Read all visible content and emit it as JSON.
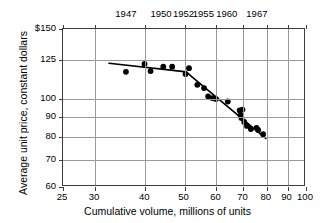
{
  "chart_data": {
    "type": "scatter",
    "title": "",
    "xlabel": "Cumulative volume, millions of units",
    "ylabel": "Average unit price, constant dollars",
    "xscale": "log",
    "yscale": "log",
    "xlim": [
      25,
      100
    ],
    "ylim": [
      60,
      150
    ],
    "grid": true,
    "legend": null,
    "xticks": [
      25,
      30,
      40,
      50,
      60,
      70,
      80,
      90,
      100
    ],
    "xticklabels": [
      "25",
      "30",
      "40",
      "50",
      "60",
      "70",
      "80",
      "90",
      "100"
    ],
    "yticks": [
      60,
      70,
      80,
      90,
      100,
      125,
      150
    ],
    "yticklabels": [
      "60",
      "70",
      "80",
      "90",
      "100",
      "125",
      "$150"
    ],
    "secondary_xaxis": {
      "label": "",
      "ticks": [
        36,
        44,
        50,
        56,
        64,
        76
      ],
      "ticklabels": [
        "1947",
        "1950",
        "1952",
        "1955",
        "1960",
        "1967"
      ]
    },
    "series": [
      {
        "name": "Average unit price",
        "type": "scatter",
        "marker": "filled-circle",
        "color": "#000000",
        "points": [
          {
            "x": 35.8,
            "y": 117.0
          },
          {
            "x": 39.8,
            "y": 122.5
          },
          {
            "x": 41.2,
            "y": 117.5
          },
          {
            "x": 44.3,
            "y": 120.5
          },
          {
            "x": 46.6,
            "y": 120.5
          },
          {
            "x": 50.3,
            "y": 115.5
          },
          {
            "x": 51.3,
            "y": 119.5
          },
          {
            "x": 53.8,
            "y": 108.5
          },
          {
            "x": 55.9,
            "y": 106.5
          },
          {
            "x": 57.2,
            "y": 101.5
          },
          {
            "x": 58.6,
            "y": 100.5
          },
          {
            "x": 59.8,
            "y": 100.0
          },
          {
            "x": 64.0,
            "y": 98.5
          },
          {
            "x": 68.5,
            "y": 93.5
          },
          {
            "x": 68.9,
            "y": 91.0
          },
          {
            "x": 69.2,
            "y": 89.5
          },
          {
            "x": 69.6,
            "y": 94.0
          },
          {
            "x": 70.3,
            "y": 87.5
          },
          {
            "x": 71.4,
            "y": 85.5
          },
          {
            "x": 73.0,
            "y": 84.0
          },
          {
            "x": 75.4,
            "y": 84.5
          },
          {
            "x": 76.1,
            "y": 83.5
          },
          {
            "x": 78.3,
            "y": 81.5
          }
        ]
      },
      {
        "name": "Fitted experience curve",
        "type": "line",
        "color": "#000000",
        "vertices": [
          {
            "x": 32.5,
            "y": 123.0
          },
          {
            "x": 50.5,
            "y": 117.0
          },
          {
            "x": 52.0,
            "y": 114.0
          },
          {
            "x": 79.5,
            "y": 79.5
          }
        ]
      }
    ]
  }
}
